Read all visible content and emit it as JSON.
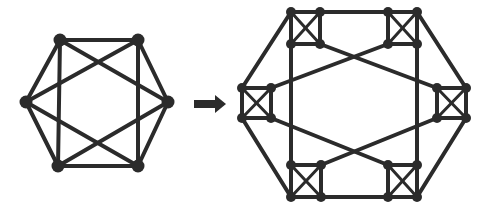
{
  "colors": {
    "stroke": "#2b2b2b",
    "node": "#2b2b2b",
    "background": "#ffffff"
  },
  "left_graph": {
    "name": "hexagon-complete-graph",
    "nodes": [
      {
        "id": "A",
        "x": 60,
        "y": 40
      },
      {
        "id": "B",
        "x": 138,
        "y": 40
      },
      {
        "id": "C",
        "x": 168,
        "y": 102
      },
      {
        "id": "D",
        "x": 138,
        "y": 166
      },
      {
        "id": "E",
        "x": 58,
        "y": 166
      },
      {
        "id": "F",
        "x": 26,
        "y": 102
      }
    ],
    "edges": [
      [
        "A",
        "B"
      ],
      [
        "B",
        "C"
      ],
      [
        "C",
        "D"
      ],
      [
        "D",
        "E"
      ],
      [
        "E",
        "F"
      ],
      [
        "F",
        "A"
      ],
      [
        "A",
        "E"
      ],
      [
        "B",
        "D"
      ],
      [
        "A",
        "C"
      ],
      [
        "B",
        "F"
      ],
      [
        "F",
        "D"
      ],
      [
        "E",
        "C"
      ]
    ]
  },
  "arrow": {
    "x1": 194,
    "x2": 226,
    "y": 104
  },
  "right_graph": {
    "name": "expanded-graph-with-cliques",
    "clusters": [
      {
        "id": "TL",
        "tl": [
          291,
          12
        ],
        "tr": [
          320,
          12
        ],
        "bl": [
          291,
          44
        ],
        "br": [
          320,
          44
        ]
      },
      {
        "id": "TR",
        "tl": [
          388,
          12
        ],
        "tr": [
          417,
          12
        ],
        "bl": [
          388,
          44
        ],
        "br": [
          417,
          44
        ]
      },
      {
        "id": "L",
        "tl": [
          242,
          88
        ],
        "tr": [
          271,
          88
        ],
        "bl": [
          242,
          118
        ],
        "br": [
          271,
          118
        ]
      },
      {
        "id": "R",
        "tl": [
          437,
          88
        ],
        "tr": [
          466,
          88
        ],
        "bl": [
          437,
          118
        ],
        "br": [
          466,
          118
        ]
      },
      {
        "id": "BL",
        "tl": [
          291,
          165
        ],
        "tr": [
          321,
          165
        ],
        "bl": [
          291,
          197
        ],
        "br": [
          321,
          197
        ]
      },
      {
        "id": "BR",
        "tl": [
          388,
          165
        ],
        "tr": [
          417,
          165
        ],
        "bl": [
          388,
          197
        ],
        "br": [
          417,
          197
        ]
      }
    ],
    "edges": [
      [
        [
          320,
          12
        ],
        [
          388,
          12
        ]
      ],
      [
        [
          321,
          197
        ],
        [
          388,
          197
        ]
      ],
      [
        [
          291,
          12
        ],
        [
          242,
          88
        ]
      ],
      [
        [
          242,
          118
        ],
        [
          291,
          197
        ]
      ],
      [
        [
          417,
          12
        ],
        [
          466,
          88
        ]
      ],
      [
        [
          466,
          118
        ],
        [
          417,
          197
        ]
      ],
      [
        [
          291,
          44
        ],
        [
          291,
          165
        ]
      ],
      [
        [
          417,
          44
        ],
        [
          417,
          165
        ]
      ],
      [
        [
          320,
          44
        ],
        [
          437,
          88
        ]
      ],
      [
        [
          388,
          44
        ],
        [
          271,
          88
        ]
      ],
      [
        [
          271,
          118
        ],
        [
          388,
          165
        ]
      ],
      [
        [
          437,
          118
        ],
        [
          321,
          165
        ]
      ]
    ]
  }
}
